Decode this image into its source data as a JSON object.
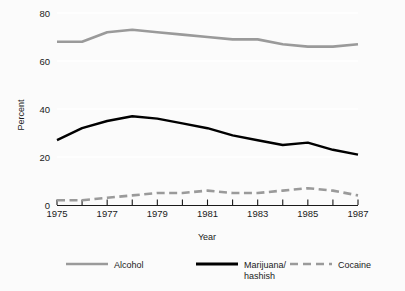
{
  "chart_data": {
    "type": "line",
    "title": "",
    "xlabel": "Year",
    "ylabel": "Percent",
    "x": [
      1975,
      1976,
      1977,
      1978,
      1979,
      1980,
      1981,
      1982,
      1983,
      1984,
      1985,
      1986,
      1987
    ],
    "xtick_labels": [
      "1975",
      "1977",
      "1979",
      "1981",
      "1983",
      "1985",
      "1987"
    ],
    "xtick_values": [
      1975,
      1977,
      1979,
      1981,
      1983,
      1985,
      1987
    ],
    "ytick_labels": [
      "0",
      "20",
      "40",
      "60",
      "80"
    ],
    "ytick_values": [
      0,
      20,
      40,
      60,
      80
    ],
    "xlim": [
      1975,
      1987
    ],
    "ylim": [
      0,
      80
    ],
    "grid": "horizontal",
    "legend_position": "bottom",
    "series": [
      {
        "name": "Alcohol",
        "style": "solid",
        "color": "#9a9a9a",
        "values": [
          68,
          68,
          72,
          73,
          72,
          71,
          70,
          69,
          69,
          67,
          66,
          66,
          67
        ]
      },
      {
        "name": "Marijuana/\nhashish",
        "label_line1": "Marijuana/",
        "label_line2": "hashish",
        "style": "solid",
        "color": "#000000",
        "values": [
          27,
          32,
          35,
          37,
          36,
          34,
          32,
          29,
          27,
          25,
          26,
          23,
          21
        ]
      },
      {
        "name": "Cocaine",
        "style": "dashed",
        "color": "#9a9a9a",
        "values": [
          2,
          2,
          3,
          4,
          5,
          5,
          6,
          5,
          5,
          6,
          7,
          6,
          4
        ]
      }
    ]
  },
  "axes": {
    "y_title": "Percent",
    "x_title": "Year",
    "y_ticks": [
      "80",
      "60",
      "40",
      "20",
      "0"
    ],
    "x_ticks": [
      "1975",
      "1977",
      "1979",
      "1981",
      "1983",
      "1985",
      "1987"
    ]
  },
  "legend": {
    "items": [
      {
        "label": "Alcohol",
        "label2": ""
      },
      {
        "label": "Marijuana/",
        "label2": "hashish"
      },
      {
        "label": "Cocaine",
        "label2": ""
      }
    ]
  },
  "colors": {
    "background": "#fbfbfb",
    "alcohol": "#9a9a9a",
    "marijuana": "#000000",
    "cocaine": "#9a9a9a",
    "grid": "#ffffff",
    "axis": "#1a1a1a"
  }
}
